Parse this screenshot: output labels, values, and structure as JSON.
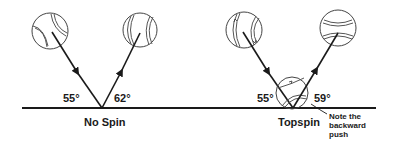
{
  "diagram": {
    "colors": {
      "ink": "#1a1a1a",
      "ball_outline": "#444444",
      "background": "#ffffff"
    },
    "panels": [
      {
        "caption": "No Spin",
        "incoming_angle": "55°",
        "outgoing_angle": "62°"
      },
      {
        "caption": "Topspin",
        "incoming_angle": "55°",
        "outgoing_angle": "59°",
        "note": [
          "Note the",
          "backward",
          "push"
        ]
      }
    ]
  }
}
